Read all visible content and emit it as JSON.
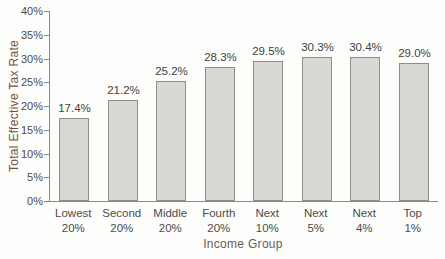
{
  "chart_data": {
    "type": "bar",
    "title": "",
    "categories": [
      {
        "line1": "Lowest",
        "line2": "20%"
      },
      {
        "line1": "Second",
        "line2": "20%"
      },
      {
        "line1": "Middle",
        "line2": "20%"
      },
      {
        "line1": "Fourth",
        "line2": "20%"
      },
      {
        "line1": "Next",
        "line2": "10%"
      },
      {
        "line1": "Next",
        "line2": "5%"
      },
      {
        "line1": "Next",
        "line2": "4%"
      },
      {
        "line1": "Top",
        "line2": "1%"
      }
    ],
    "values": [
      17.4,
      21.2,
      25.2,
      28.3,
      29.5,
      30.3,
      30.4,
      29.0
    ],
    "value_labels": [
      "17.4%",
      "21.2%",
      "25.2%",
      "28.3%",
      "29.5%",
      "30.3%",
      "30.4%",
      "29.0%"
    ],
    "xlabel": "Income Group",
    "ylabel": "Total Effective Tax Rate",
    "ylim": [
      0,
      40
    ],
    "yticks": [
      0,
      5,
      10,
      15,
      20,
      25,
      30,
      35,
      40
    ],
    "ytick_labels": [
      "0%",
      "5%",
      "10%",
      "15%",
      "20%",
      "25%",
      "30%",
      "35%",
      "40%"
    ],
    "grid": false,
    "colors": {
      "bar_fill": "#d9d8d5",
      "bar_border": "#8f8c88",
      "axis_line": "#8a8a8a",
      "tick_text": "#4b4b4b",
      "value_text": "#3f3f3f",
      "category_text": "#4b4b4b",
      "xlabel_text": "#5f5f5f",
      "ylabel_text": "#74503f"
    }
  }
}
